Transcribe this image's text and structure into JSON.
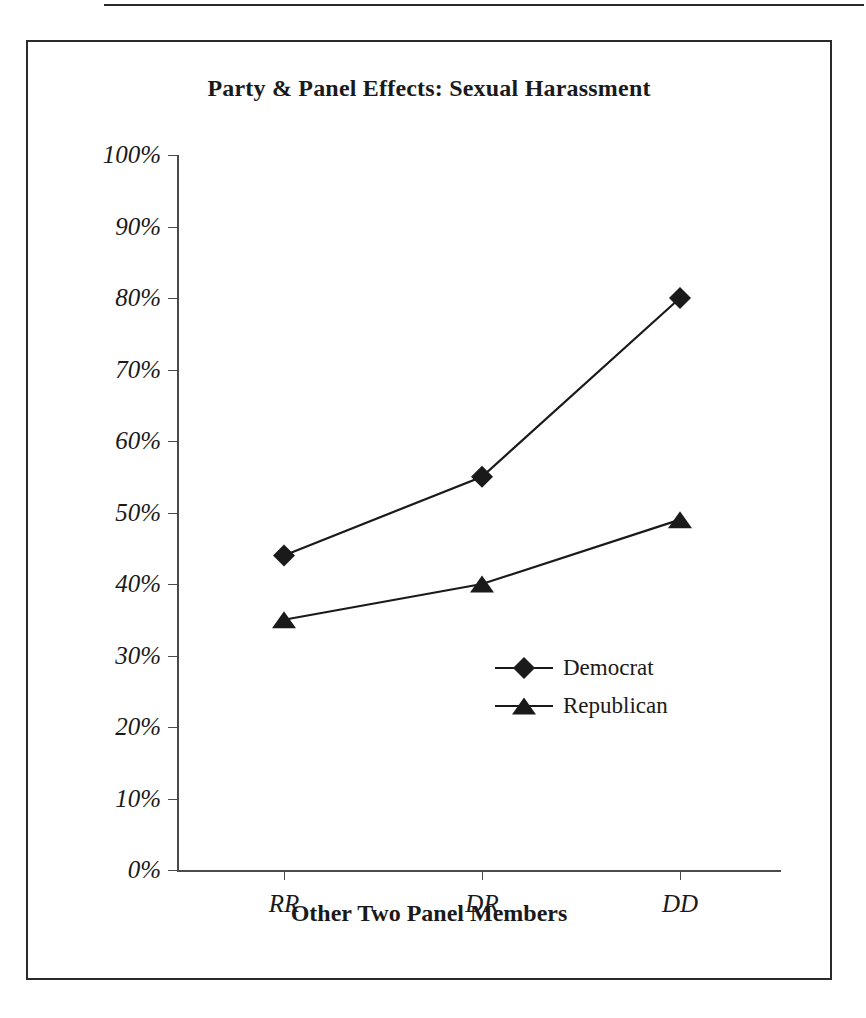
{
  "figure": {
    "title": "Party & Panel Effects: Sexual Harassment",
    "x_axis_title": "Other Two Panel Members",
    "y_axis_title": "% Voting for Liberal Position"
  },
  "legend": {
    "items": [
      {
        "label": "Democrat",
        "marker": "diamond-marker"
      },
      {
        "label": "Republican",
        "marker": "triangle-marker"
      }
    ]
  },
  "chart_data": {
    "type": "line",
    "title": "Party & Panel Effects: Sexual Harassment",
    "xlabel": "Other Two Panel Members",
    "ylabel": "% Voting for Liberal Position",
    "categories": [
      "RR",
      "DR",
      "DD"
    ],
    "series": [
      {
        "name": "Democrat",
        "values": [
          44,
          55,
          80
        ],
        "marker": "diamond",
        "color": "#1a1a1a"
      },
      {
        "name": "Republican",
        "values": [
          35,
          40,
          49
        ],
        "marker": "triangle",
        "color": "#1a1a1a"
      }
    ],
    "ylim": [
      0,
      100
    ],
    "ytick_labels": [
      "100%",
      "90%",
      "80%",
      "70%",
      "60%",
      "50%",
      "40%",
      "30%",
      "20%",
      "10%",
      "0%"
    ],
    "ytick_values": [
      100,
      90,
      80,
      70,
      60,
      50,
      40,
      30,
      20,
      10,
      0
    ],
    "grid": false,
    "legend_position": "inside-lower-right"
  }
}
